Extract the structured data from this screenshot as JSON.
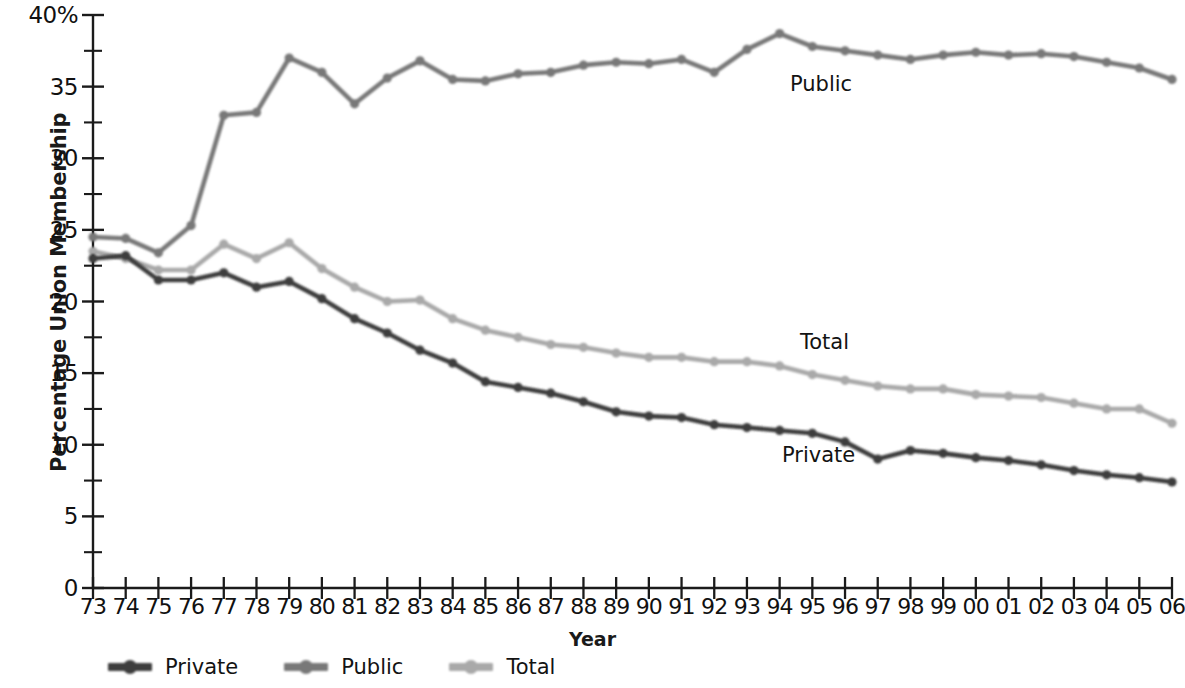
{
  "chart_data": {
    "type": "line",
    "title": "",
    "xlabel": "Year",
    "ylabel": "Percentage Union Membership",
    "x": [
      "73",
      "74",
      "75",
      "76",
      "77",
      "78",
      "79",
      "80",
      "81",
      "82",
      "83",
      "84",
      "85",
      "86",
      "87",
      "88",
      "89",
      "90",
      "91",
      "92",
      "93",
      "94",
      "95",
      "96",
      "97",
      "98",
      "99",
      "00",
      "01",
      "02",
      "03",
      "04",
      "05",
      "06"
    ],
    "xlim": [
      1973,
      2006
    ],
    "ylim": [
      0,
      40
    ],
    "y_ticks": [
      "0",
      "5",
      "10",
      "15",
      "20",
      "25",
      "30",
      "35",
      "40%"
    ],
    "y_tick_values": [
      0,
      5,
      10,
      15,
      20,
      25,
      30,
      35,
      40
    ],
    "y_minor_tick_values": [
      2.5,
      7.5,
      12.5,
      17.5,
      22.5,
      27.5,
      32.5,
      37.5
    ],
    "grid": false,
    "legend_position": "bottom-left",
    "series": [
      {
        "name": "Private",
        "color": "#3d3d3d",
        "label_on_plot": "Private",
        "values": [
          23.0,
          23.2,
          21.5,
          21.5,
          22.0,
          21.0,
          21.4,
          20.2,
          18.8,
          17.8,
          16.6,
          15.7,
          14.4,
          14.0,
          13.6,
          13.0,
          12.3,
          12.0,
          11.9,
          11.4,
          11.2,
          11.0,
          10.8,
          10.2,
          9.0,
          9.6,
          9.4,
          9.1,
          8.9,
          8.6,
          8.2,
          7.9,
          7.7,
          7.4
        ]
      },
      {
        "name": "Public",
        "color": "#787878",
        "label_on_plot": "Public",
        "values": [
          24.5,
          24.4,
          23.4,
          25.3,
          33.0,
          33.2,
          37.0,
          36.0,
          33.8,
          35.6,
          36.8,
          35.5,
          35.4,
          35.9,
          36.0,
          36.5,
          36.7,
          36.6,
          36.9,
          36.0,
          37.6,
          38.7,
          37.8,
          37.5,
          37.2,
          36.9,
          37.2,
          37.4,
          37.2,
          37.3,
          37.1,
          36.7,
          36.3,
          35.5
        ]
      },
      {
        "name": "Total",
        "color": "#a9a9a9",
        "label_on_plot": "Total",
        "values": [
          23.5,
          23.0,
          22.2,
          22.2,
          24.0,
          23.0,
          24.1,
          22.3,
          21.0,
          20.0,
          20.1,
          18.8,
          18.0,
          17.5,
          17.0,
          16.8,
          16.4,
          16.1,
          16.1,
          15.8,
          15.8,
          15.5,
          14.9,
          14.5,
          14.1,
          13.9,
          13.9,
          13.5,
          13.4,
          13.3,
          12.9,
          12.5,
          12.5,
          11.5
        ]
      }
    ]
  },
  "axes": {
    "y_title": "Percentage Union Membership",
    "x_title": "Year"
  },
  "legend": {
    "items": [
      {
        "label": "Private",
        "color": "#3d3d3d"
      },
      {
        "label": "Public",
        "color": "#787878"
      },
      {
        "label": "Total",
        "color": "#a9a9a9"
      }
    ]
  },
  "plot_labels": [
    {
      "text": "Public",
      "x": 790,
      "y": 72
    },
    {
      "text": "Total",
      "x": 800,
      "y": 330
    },
    {
      "text": "Private",
      "x": 782,
      "y": 443
    }
  ],
  "colors": {
    "axis": "#1b1b1b",
    "text": "#111111",
    "background": "#ffffff"
  }
}
